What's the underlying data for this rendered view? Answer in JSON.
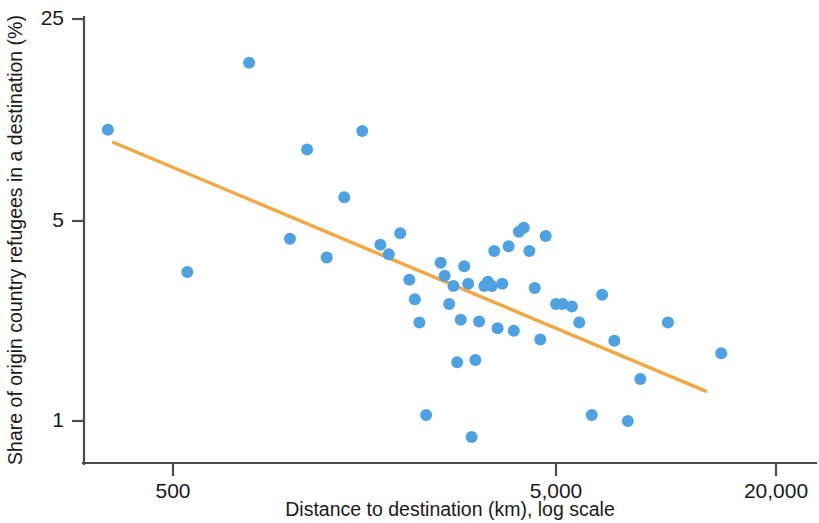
{
  "chart_data": {
    "type": "scatter",
    "title": "",
    "subtitle": "",
    "xlabel": "Distance to destination (km), log scale",
    "ylabel": "Share of origin country refugees in a destination (%)",
    "x_scale": "log",
    "y_scale": "log",
    "xticks": [
      500,
      5000,
      20000
    ],
    "xticklabels": [
      "500",
      "5,000",
      "20,000"
    ],
    "yticks": [
      1,
      5,
      25
    ],
    "yticklabels": [
      "1",
      "5",
      "25"
    ],
    "xlim": [
      330,
      26000
    ],
    "ylim": [
      0.78,
      25
    ],
    "grid": false,
    "legend": null,
    "series": [
      {
        "name": "destinations",
        "type": "scatter",
        "color": "#4ea1e3",
        "marker": "circle",
        "marker_size": 11,
        "points": [
          {
            "x": 338,
            "y": 10.3
          },
          {
            "x": 545,
            "y": 3.3
          },
          {
            "x": 790,
            "y": 17.6
          },
          {
            "x": 1010,
            "y": 4.3
          },
          {
            "x": 1120,
            "y": 8.8
          },
          {
            "x": 1260,
            "y": 3.7
          },
          {
            "x": 1400,
            "y": 6.0
          },
          {
            "x": 1560,
            "y": 10.2
          },
          {
            "x": 1740,
            "y": 4.1
          },
          {
            "x": 1830,
            "y": 3.8
          },
          {
            "x": 1960,
            "y": 4.5
          },
          {
            "x": 2070,
            "y": 3.1
          },
          {
            "x": 2140,
            "y": 2.65
          },
          {
            "x": 2200,
            "y": 2.2
          },
          {
            "x": 2290,
            "y": 1.05
          },
          {
            "x": 2500,
            "y": 3.55
          },
          {
            "x": 2560,
            "y": 3.2
          },
          {
            "x": 2630,
            "y": 2.55
          },
          {
            "x": 2700,
            "y": 2.95
          },
          {
            "x": 2760,
            "y": 1.6
          },
          {
            "x": 2820,
            "y": 2.25
          },
          {
            "x": 2880,
            "y": 3.45
          },
          {
            "x": 2950,
            "y": 3.0
          },
          {
            "x": 3010,
            "y": 0.88
          },
          {
            "x": 3080,
            "y": 1.63
          },
          {
            "x": 3150,
            "y": 2.22
          },
          {
            "x": 3250,
            "y": 2.95
          },
          {
            "x": 3320,
            "y": 3.05
          },
          {
            "x": 3400,
            "y": 2.95
          },
          {
            "x": 3450,
            "y": 3.9
          },
          {
            "x": 3520,
            "y": 2.1
          },
          {
            "x": 3620,
            "y": 3.0
          },
          {
            "x": 3760,
            "y": 4.05
          },
          {
            "x": 3880,
            "y": 2.06
          },
          {
            "x": 4000,
            "y": 4.55
          },
          {
            "x": 4120,
            "y": 4.7
          },
          {
            "x": 4260,
            "y": 3.9
          },
          {
            "x": 4400,
            "y": 2.9
          },
          {
            "x": 4550,
            "y": 1.92
          },
          {
            "x": 4700,
            "y": 4.4
          },
          {
            "x": 5000,
            "y": 2.55
          },
          {
            "x": 5200,
            "y": 2.55
          },
          {
            "x": 5500,
            "y": 2.5
          },
          {
            "x": 5750,
            "y": 2.2
          },
          {
            "x": 6200,
            "y": 1.05
          },
          {
            "x": 6600,
            "y": 2.75
          },
          {
            "x": 7100,
            "y": 1.9
          },
          {
            "x": 7700,
            "y": 1.0
          },
          {
            "x": 8300,
            "y": 1.4
          },
          {
            "x": 9800,
            "y": 2.2
          },
          {
            "x": 13500,
            "y": 1.72
          }
        ]
      },
      {
        "name": "fitted trend",
        "type": "line",
        "color": "#f2a742",
        "endpoints": [
          {
            "x": 350,
            "y": 9.3
          },
          {
            "x": 12300,
            "y": 1.27
          }
        ]
      }
    ]
  },
  "axes": {
    "x_title": "Distance to destination (km), log scale",
    "y_title": "Share of origin country refugees in a destination (%)",
    "x_tick_labels": [
      "500",
      "5,000",
      "20,000"
    ],
    "y_tick_labels": [
      "25",
      "5",
      "1"
    ]
  },
  "colors": {
    "point": "#4ea1e3",
    "trend": "#f2a742",
    "axis": "#4d4d4d",
    "text": "#1a1a1a",
    "background": "#ffffff"
  }
}
